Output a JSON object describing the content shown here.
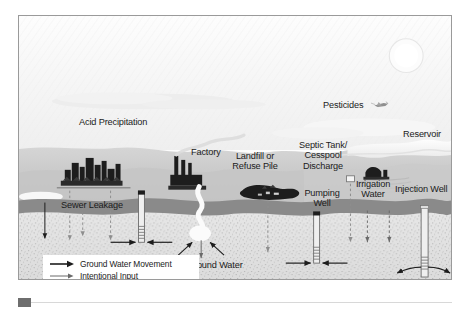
{
  "figure": {
    "kind": "diagram",
    "frame_border_color": "#9a9a9a",
    "background_color": "#fdfdfd"
  },
  "palette": {
    "sky": "#f4f4f4",
    "sky_haze": "#ececec",
    "cloud": "#fafafa",
    "land_surface": "#cfcfcf",
    "land_mid": "#bdbdbd",
    "confining_layer": "#8a8a8a",
    "aquifer": "#e0e0e0",
    "aquifer_speckle": "#a8a8a8",
    "structure_dark": "#1d1d1d",
    "well_pipe": "#efefef",
    "well_outline": "#6d6d6d",
    "text": "#1b1b1b",
    "arrow_groundwater": "#1d1d1d",
    "arrow_intentional": "#6a6a6a",
    "arrow_unintentional": "#8e8e8e"
  },
  "scene": {
    "sun": {
      "name": "sun",
      "visible": true
    },
    "horizon_label": "land surface"
  },
  "labels": [
    {
      "id": "acid-precipitation",
      "text": "Acid Precipitation",
      "x": 78,
      "y": 117,
      "size": "main",
      "align": "left"
    },
    {
      "id": "pesticides",
      "text": "Pesticides",
      "x": 322,
      "y": 100,
      "size": "main",
      "align": "left"
    },
    {
      "id": "reservoir",
      "text": "Reservoir",
      "x": 402,
      "y": 128,
      "size": "main",
      "align": "left"
    },
    {
      "id": "factory",
      "text": "Factory",
      "x": 190,
      "y": 147,
      "size": "main",
      "align": "left"
    },
    {
      "id": "landfill",
      "text": "Landfill or\nRefuse Pile",
      "x": 236,
      "y": 152,
      "size": "main",
      "align": "center"
    },
    {
      "id": "septic-tank",
      "text": "Septic Tank/\nCesspool\nDischarge",
      "x": 304,
      "y": 143,
      "size": "main",
      "align": "center"
    },
    {
      "id": "pumping-well",
      "text": "Pumping\nWell",
      "x": 303,
      "y": 188,
      "size": "main",
      "align": "center"
    },
    {
      "id": "irrigation-water",
      "text": "Irrigation\nWater",
      "x": 354,
      "y": 178,
      "size": "main",
      "align": "center"
    },
    {
      "id": "injection-well",
      "text": "Injection Well",
      "x": 395,
      "y": 183,
      "size": "main",
      "align": "left"
    },
    {
      "id": "sewer-leakage",
      "text": "Sewer Leakage",
      "x": 60,
      "y": 200,
      "size": "main",
      "align": "left"
    },
    {
      "id": "ground-water",
      "text": "Ground Water",
      "x": 186,
      "y": 260,
      "size": "main",
      "align": "left"
    }
  ],
  "legend": {
    "name": "legend",
    "items": [
      {
        "id": "ground-water-movement",
        "label": "Ground Water Movement",
        "arrow_icon": "solid-arrow-right",
        "color": "#1d1d1d",
        "weight": 1.6
      },
      {
        "id": "intentional-input",
        "label": "Intentional Input",
        "arrow_icon": "solid-arrow-right",
        "color": "#6a6a6a",
        "weight": 1.0
      },
      {
        "id": "unintentional-input",
        "label": "Unintentional Input",
        "arrow_icon": "solid-arrow-right",
        "color": "#8e8e8e",
        "weight": 1.0
      }
    ]
  },
  "features": [
    {
      "id": "city-skyline",
      "name": "city-skyline",
      "type": "silhouette"
    },
    {
      "id": "sewer-pipe",
      "name": "sewer-pipe",
      "type": "line"
    },
    {
      "id": "factory-stack",
      "name": "factory-building",
      "type": "silhouette"
    },
    {
      "id": "refuse-pile",
      "name": "refuse-pile",
      "type": "silhouette"
    },
    {
      "id": "farm-barn",
      "name": "farm-barn",
      "type": "silhouette"
    },
    {
      "id": "crop-plane",
      "name": "crop-duster-plane-icon",
      "type": "icon"
    },
    {
      "id": "stream",
      "name": "stream",
      "type": "river"
    },
    {
      "id": "well-left",
      "name": "pumping-well-left",
      "type": "well"
    },
    {
      "id": "well-center",
      "name": "pumping-well-center",
      "type": "well"
    },
    {
      "id": "well-right",
      "name": "injection-well",
      "type": "well"
    },
    {
      "id": "confining-bed",
      "name": "confining-layer",
      "type": "stratum"
    },
    {
      "id": "aquifer",
      "name": "aquifer",
      "type": "stratum"
    }
  ]
}
